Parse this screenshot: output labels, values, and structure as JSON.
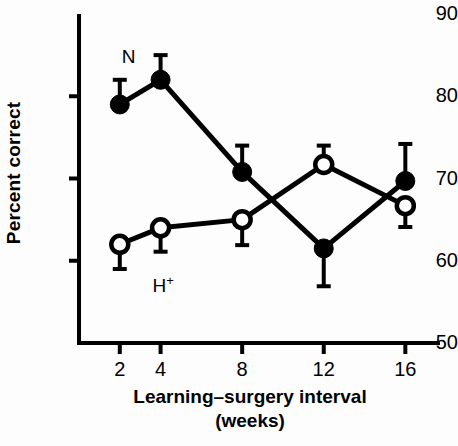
{
  "chart_data": {
    "type": "line",
    "title": "",
    "xlabel": "Learning–surgery interval",
    "xlabel_line2": "(weeks)",
    "ylabel": "Percent correct",
    "x": [
      2,
      4,
      8,
      12,
      16
    ],
    "xtick_labels": [
      "2",
      "4",
      "8",
      "12",
      "16"
    ],
    "ytick_labels": [
      "50",
      "60",
      "70",
      "80",
      "90"
    ],
    "yticks": [
      50,
      60,
      70,
      80,
      90
    ],
    "xlim": [
      0,
      17.7
    ],
    "ylim": [
      50,
      90
    ],
    "grid": false,
    "legend_position": "inline-annotations",
    "series": [
      {
        "name": "N",
        "marker": "filled-circle",
        "annotation": "N",
        "annotation_x": 2.1,
        "annotation_y": 84.8,
        "values": [
          79.0,
          82.0,
          70.8,
          61.5,
          69.7
        ],
        "errors_upper": [
          3.0,
          3.0,
          3.2,
          0.0,
          4.5
        ],
        "errors_lower": [
          0.0,
          0.0,
          0.0,
          4.6,
          0.0
        ],
        "color": "#000000"
      },
      {
        "name": "H+",
        "marker": "open-circle",
        "annotation": "H",
        "annotation_superscript": "+",
        "annotation_x": 3.6,
        "annotation_y": 57.2,
        "values": [
          62.0,
          64.0,
          65.0,
          71.7,
          66.7
        ],
        "errors_upper": [
          0.0,
          0.0,
          0.0,
          2.3,
          0.0
        ],
        "errors_lower": [
          3.0,
          2.9,
          3.1,
          0.0,
          2.6
        ],
        "color": "#000000"
      }
    ]
  },
  "axis": {
    "line_color": "#000000",
    "line_width": 4
  }
}
